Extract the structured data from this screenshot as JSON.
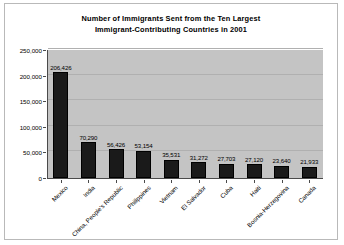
{
  "chart_data": {
    "type": "bar",
    "title": "Number of Immigrants Sent from the Ten Largest Immigrant-Contributing Countries in 2001",
    "title_lines": [
      "Number of Immigrants Sent from the Ten Largest",
      "Immigrant-Contributing Countries in 2001"
    ],
    "xlabel": "",
    "ylabel": "",
    "ylim": [
      0,
      250000
    ],
    "ytick_values": [
      0,
      50000,
      100000,
      150000,
      200000,
      250000
    ],
    "ytick_labels": [
      "0",
      "50,000",
      "100,000",
      "150,000",
      "200,000",
      "250,000"
    ],
    "grid": true,
    "legend": false,
    "categories": [
      "Mexico",
      "India",
      "China, People's Republic",
      "Philippines",
      "Vietnam",
      "El Salvador",
      "Cuba",
      "Haiti",
      "Bosnia-Herzegovina",
      "Canada"
    ],
    "values": [
      206426,
      70290,
      56426,
      53154,
      35531,
      31272,
      27703,
      27120,
      23640,
      21933
    ],
    "value_labels": [
      "206,426",
      "70,290",
      "56,426",
      "53,154",
      "35,531",
      "31,272",
      "27,703",
      "27,120",
      "23,640",
      "21,933"
    ],
    "bar_color": "#1a1a1a",
    "plot_background": "#c4c4c4",
    "canvas_background": "#ffffff"
  }
}
